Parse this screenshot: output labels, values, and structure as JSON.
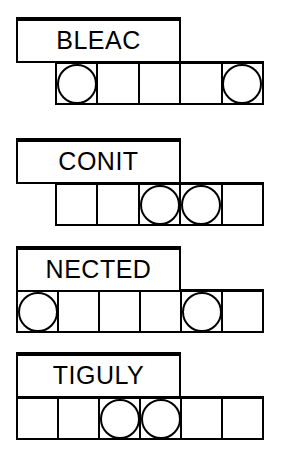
{
  "worksheet": {
    "title": "Word Puzzle Worksheet",
    "ink_color": "#000000",
    "paper_color": "#ffffff"
  },
  "puzzles": [
    {
      "id": "puzzle-1",
      "word": "BLEAC",
      "cell_count": 5,
      "circled_cells": [
        1,
        5
      ],
      "cells": [
        {
          "index": 1,
          "value": "",
          "circled": true
        },
        {
          "index": 2,
          "value": "",
          "circled": false
        },
        {
          "index": 3,
          "value": "",
          "circled": false
        },
        {
          "index": 4,
          "value": "",
          "circled": false
        },
        {
          "index": 5,
          "value": "",
          "circled": true
        }
      ]
    },
    {
      "id": "puzzle-2",
      "word": "CONIT",
      "cell_count": 5,
      "circled_cells": [
        3,
        4
      ],
      "cells": [
        {
          "index": 1,
          "value": "",
          "circled": false
        },
        {
          "index": 2,
          "value": "",
          "circled": false
        },
        {
          "index": 3,
          "value": "",
          "circled": true
        },
        {
          "index": 4,
          "value": "",
          "circled": true
        },
        {
          "index": 5,
          "value": "",
          "circled": false
        }
      ]
    },
    {
      "id": "puzzle-3",
      "word": "NECTED",
      "cell_count": 6,
      "circled_cells": [
        1,
        5
      ],
      "cells": [
        {
          "index": 1,
          "value": "",
          "circled": true
        },
        {
          "index": 2,
          "value": "",
          "circled": false
        },
        {
          "index": 3,
          "value": "",
          "circled": false
        },
        {
          "index": 4,
          "value": "",
          "circled": false
        },
        {
          "index": 5,
          "value": "",
          "circled": true
        },
        {
          "index": 6,
          "value": "",
          "circled": false
        }
      ]
    },
    {
      "id": "puzzle-4",
      "word": "TIGULY",
      "cell_count": 6,
      "circled_cells": [
        3,
        4
      ],
      "cells": [
        {
          "index": 1,
          "value": "",
          "circled": false
        },
        {
          "index": 2,
          "value": "",
          "circled": false
        },
        {
          "index": 3,
          "value": "",
          "circled": true
        },
        {
          "index": 4,
          "value": "",
          "circled": true
        },
        {
          "index": 5,
          "value": "",
          "circled": false
        },
        {
          "index": 6,
          "value": "",
          "circled": false
        }
      ]
    }
  ]
}
